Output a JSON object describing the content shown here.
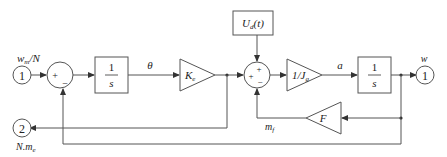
{
  "diagram": {
    "type": "block-diagram",
    "inputs": [
      {
        "id": 1,
        "port_label": "1",
        "signal_label": "w_m/N"
      }
    ],
    "outputs": [
      {
        "id": 1,
        "port_label": "1",
        "signal_label": "w"
      },
      {
        "id": 2,
        "port_label": "2",
        "signal_label": "N.m_e"
      }
    ],
    "blocks": {
      "integrator1": {
        "num": "1",
        "den": "s"
      },
      "gain_ke": {
        "label": "K",
        "sub": "e"
      },
      "disturbance": {
        "label": "U",
        "sub": "d",
        "arg": "(t)"
      },
      "gain_jg": {
        "label": "1/J",
        "sub": "g"
      },
      "integrator2": {
        "num": "1",
        "den": "s"
      },
      "gain_f": {
        "label": "F"
      }
    },
    "summers": {
      "sum1": {
        "left_sign": "+",
        "bottom_sign": "−"
      },
      "sum2": {
        "top_sign": "+",
        "left_sign": "+",
        "bottom_sign": "−"
      }
    },
    "signals": {
      "theta": "θ",
      "a": "a",
      "mf": "m",
      "mf_sub": "f"
    }
  }
}
